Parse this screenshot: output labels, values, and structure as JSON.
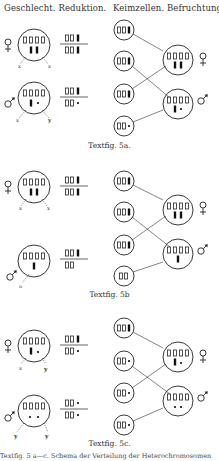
{
  "headers": {
    "left": "Geschlecht. Reduktion.",
    "right": "Keimzellen. Befruchtung."
  },
  "panels": [
    {
      "id": "5a",
      "caption": "Textfig. 5a.",
      "female": {
        "symbol": "♀",
        "chromosomes_top": "▯▯▯▯",
        "chromosomes_bottom": "▮▮",
        "labels": [
          "x",
          "x"
        ],
        "fraction_top": "▯▯▮",
        "fraction_bottom": "▯▯▮"
      },
      "male": {
        "symbol": "♂",
        "chromosomes_top": "▯▯▯▯",
        "chromosomes_bottom": "▮•",
        "labels": [
          "x",
          "y"
        ],
        "fraction_top": "▯▯▮",
        "fraction_bottom": "▯▯•"
      },
      "gametes": [
        "▯▯▮",
        "▯▯▮",
        "▯▯▮",
        "▯▯•"
      ],
      "offspring": [
        {
          "symbol": "♀",
          "top": "▯▯▯▯",
          "bottom": "▮▮"
        },
        {
          "symbol": "♂",
          "top": "▯▯▯▯",
          "bottom": "▮•"
        }
      ]
    },
    {
      "id": "5b",
      "caption": "Textfig. 5b",
      "female": {
        "symbol": "♀",
        "chromosomes_top": "▯▯▯▯",
        "chromosomes_bottom": "▮▮",
        "labels": [
          "x",
          "x"
        ],
        "fraction_top": "▯▯▮",
        "fraction_bottom": "▯▯▮"
      },
      "male": {
        "symbol": "♂",
        "chromosomes_top": "▯▯▯▯",
        "chromosomes_bottom": "▮",
        "labels": [
          "o"
        ],
        "fraction_top": "▯▯▮",
        "fraction_bottom": "▯▯"
      },
      "gametes": [
        "▯▯▮",
        "▯▯▮",
        "▯▯▮",
        "▯▯"
      ],
      "offspring": [
        {
          "symbol": "♀",
          "top": "▯▯▯▯",
          "bottom": "▮▮"
        },
        {
          "symbol": "♂",
          "top": "▯▯▯▯",
          "bottom": "▮"
        }
      ]
    },
    {
      "id": "5c",
      "caption": "Textfig. 5c.",
      "female": {
        "symbol": "♀",
        "chromosomes_top": "▯▯▯▯",
        "chromosomes_bottom": "▮•",
        "labels": [
          "x",
          "y"
        ],
        "fraction_top": "▯▯▮",
        "fraction_bottom": "▯▯•"
      },
      "male": {
        "symbol": "♂",
        "chromosomes_top": "▯▯▯▯",
        "chromosomes_bottom": "••",
        "labels": [
          "y",
          "y"
        ],
        "fraction_top": "▯▯•",
        "fraction_bottom": "▯▯•"
      },
      "gametes": [
        "▯▯▮",
        "▯▯•",
        "▯▯•",
        "▯▯•"
      ],
      "offspring": [
        {
          "symbol": "♀",
          "top": "▯▯▯▯",
          "bottom": "▮•"
        },
        {
          "symbol": "♂",
          "top": "▯▯▯▯",
          "bottom": "••"
        }
      ]
    }
  ],
  "footer": {
    "text": "Textfig. 5 a—c. Schema der Verteilung der Heterochromosomen"
  }
}
